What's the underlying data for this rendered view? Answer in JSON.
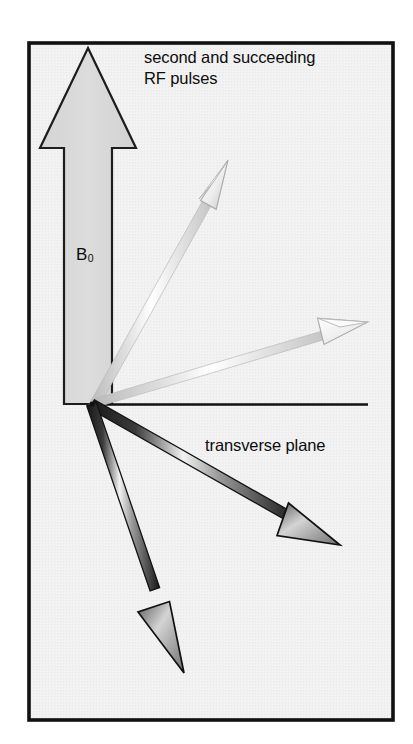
{
  "figure": {
    "title_note": "NMR magnetization vector diagram",
    "frame": {
      "x": 27,
      "y": 41,
      "width": 368,
      "height": 681,
      "border_color": "#111111",
      "fill_color": "#f0f0f0",
      "border_width": 4
    },
    "labels": {
      "rf_pulses_line1": "second and succeeding",
      "rf_pulses_line2": "RF pulses",
      "b0_base": "B",
      "b0_subscript": "0",
      "transverse_plane": "transverse plane"
    },
    "colors": {
      "ink": "#0d0d0d",
      "background": "#f0f0f0",
      "page": "#ffffff",
      "b0_arrow_fill": "#d9d9d9",
      "b0_arrow_stroke": "#1a1a1a",
      "light_vector_light": "#ffffff",
      "light_vector_mid": "#c9c9c9",
      "light_vector_stroke": "#b5b5b5",
      "dark_vector_light": "#e8e8e8",
      "dark_vector_mid": "#4a4a4a",
      "dark_vector_stroke": "#111111",
      "axis_line": "#111111"
    },
    "geometry": {
      "origin": {
        "x": 92,
        "y": 404
      },
      "transverse_axis": {
        "x1": 92,
        "y1": 404,
        "x2": 368,
        "y2": 404
      },
      "b0_arrow": {
        "tip_x": 88,
        "tip_y": 48,
        "head_base_y": 148,
        "head_half_width": 48,
        "shaft_left_x": 64,
        "shaft_right_x": 112,
        "base_y": 404
      },
      "vectors": [
        {
          "name": "light-vector-upper",
          "tip_x": 228,
          "tip_y": 160,
          "shade": "light"
        },
        {
          "name": "light-vector-lower",
          "tip_x": 368,
          "tip_y": 322,
          "shade": "light"
        },
        {
          "name": "dark-vector-right",
          "tip_x": 340,
          "tip_y": 545,
          "shade": "dark"
        },
        {
          "name": "dark-vector-down",
          "tip_x": 184,
          "tip_y": 673,
          "shade": "dark"
        }
      ]
    }
  }
}
